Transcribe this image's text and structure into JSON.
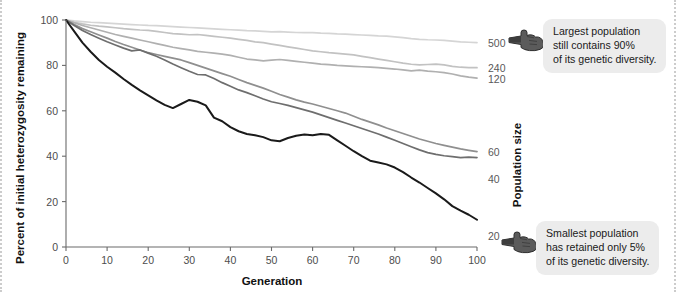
{
  "figure": {
    "background": "#ffffff",
    "border_color": "#cccccc"
  },
  "axes": {
    "y_title": "Percent of initial heterozygosity remaining",
    "x_title": "Generation",
    "right_title": "Population size",
    "x_ticks": [
      "0",
      "10",
      "20",
      "30",
      "40",
      "50",
      "60",
      "70",
      "80",
      "90",
      "100"
    ],
    "y_ticks": [
      "0",
      "20",
      "40",
      "60",
      "80",
      "100"
    ],
    "xlim": [
      0,
      100
    ],
    "ylim": [
      0,
      100
    ]
  },
  "right_labels": [
    {
      "name": "500",
      "y_value": 90
    },
    {
      "name": "240",
      "y_value": 79
    },
    {
      "name": "120",
      "y_value": 74
    },
    {
      "name": "60",
      "y_value": 42
    },
    {
      "name": "40",
      "y_value": 30
    },
    {
      "name": "20",
      "y_value": 5
    }
  ],
  "annotations": {
    "top": {
      "icon": "pointing-hand-icon",
      "lines": [
        "Largest population",
        "still contains 90%",
        "of its genetic diversity."
      ]
    },
    "bottom": {
      "icon": "pointing-hand-icon",
      "lines": [
        "Smallest population",
        "has retained only 5%",
        "of its genetic diversity."
      ]
    }
  },
  "chart_data": {
    "type": "line",
    "title": "",
    "xlabel": "Generation",
    "ylabel": "Percent of initial heterozygosity remaining",
    "right_axis_label": "Population size",
    "xlim": [
      0,
      100
    ],
    "ylim": [
      0,
      100
    ],
    "grid": false,
    "legend": "right-edge-labels",
    "x": [
      0,
      2,
      4,
      6,
      8,
      10,
      12,
      14,
      16,
      18,
      20,
      22,
      24,
      26,
      28,
      30,
      32,
      34,
      36,
      38,
      40,
      42,
      44,
      46,
      48,
      50,
      52,
      54,
      56,
      58,
      60,
      62,
      64,
      66,
      68,
      70,
      72,
      74,
      76,
      78,
      80,
      82,
      84,
      86,
      88,
      90,
      92,
      94,
      96,
      98,
      100
    ],
    "series": [
      {
        "name": "500",
        "color": "#d5d5d5",
        "values": [
          100,
          99.6,
          99.3,
          99.0,
          98.8,
          98.6,
          98.4,
          98.2,
          98.0,
          97.8,
          97.6,
          97.5,
          97.3,
          97.1,
          96.9,
          96.7,
          96.5,
          96.3,
          96.1,
          95.9,
          95.7,
          95.5,
          95.3,
          95.2,
          95.0,
          94.8,
          94.9,
          94.7,
          94.5,
          94.4,
          94.4,
          94.2,
          94.1,
          93.9,
          93.8,
          93.6,
          93.4,
          93.2,
          93.0,
          92.9,
          92.6,
          92.2,
          91.8,
          91.5,
          91.3,
          91.2,
          91.0,
          90.7,
          90.4,
          90.2,
          90.0
        ]
      },
      {
        "name": "240",
        "color": "#c2c2c2",
        "values": [
          100,
          99.0,
          98.3,
          97.7,
          97.3,
          97.0,
          96.6,
          96.2,
          95.9,
          95.6,
          95.4,
          95.0,
          94.5,
          94.0,
          93.8,
          93.5,
          93.6,
          93.2,
          92.8,
          92.4,
          92.0,
          91.5,
          91.0,
          90.4,
          90.0,
          89.4,
          88.8,
          88.2,
          87.6,
          87.0,
          86.4,
          86.0,
          85.6,
          85.3,
          85.0,
          84.6,
          84.0,
          83.4,
          82.8,
          82.2,
          81.6,
          81.0,
          80.5,
          80.2,
          80.4,
          80.6,
          80.2,
          79.6,
          79.2,
          79.0,
          79.0
        ]
      },
      {
        "name": "120",
        "color": "#b0b0b0",
        "values": [
          100,
          98.8,
          97.6,
          96.6,
          95.6,
          94.6,
          93.6,
          92.8,
          92.0,
          91.2,
          90.4,
          89.6,
          88.8,
          88.0,
          87.4,
          86.8,
          86.2,
          85.8,
          85.4,
          85.0,
          84.4,
          83.6,
          82.8,
          82.4,
          82.0,
          82.3,
          82.6,
          82.2,
          81.8,
          81.4,
          81.0,
          80.6,
          80.3,
          80.0,
          79.8,
          79.6,
          79.4,
          79.2,
          79.0,
          78.7,
          78.4,
          78.0,
          77.6,
          77.9,
          77.5,
          77.2,
          76.8,
          76.2,
          75.4,
          74.8,
          74.4
        ]
      },
      {
        "name": "60",
        "color": "#8f8f8f",
        "values": [
          100,
          98.0,
          96.2,
          94.8,
          93.4,
          92.0,
          90.5,
          89.2,
          88.0,
          86.8,
          85.6,
          84.8,
          84.0,
          83.2,
          82.4,
          81.2,
          80.0,
          78.8,
          77.6,
          76.4,
          75.2,
          73.8,
          72.4,
          71.2,
          70.0,
          68.6,
          67.2,
          66.0,
          64.8,
          63.8,
          63.0,
          62.0,
          61.0,
          60.0,
          59.0,
          57.6,
          56.2,
          55.0,
          53.8,
          52.4,
          51.2,
          50.0,
          48.8,
          47.6,
          46.6,
          45.6,
          44.8,
          44.0,
          43.2,
          42.6,
          42.0
        ]
      },
      {
        "name": "40",
        "color": "#6e6e6e",
        "values": [
          100,
          97.6,
          95.4,
          93.6,
          92.0,
          90.4,
          89.0,
          87.6,
          86.4,
          86.8,
          85.4,
          84.0,
          82.4,
          80.6,
          79.0,
          77.4,
          76.0,
          75.8,
          74.2,
          72.4,
          70.8,
          69.2,
          68.0,
          66.6,
          65.2,
          64.0,
          63.2,
          62.4,
          61.4,
          60.4,
          59.4,
          58.2,
          57.0,
          55.8,
          54.6,
          53.4,
          52.2,
          51.0,
          49.8,
          48.4,
          47.0,
          45.6,
          44.2,
          42.8,
          41.6,
          40.8,
          40.2,
          39.8,
          39.4,
          39.6,
          39.4
        ]
      },
      {
        "name": "20",
        "color": "#1a1a1a",
        "values": [
          100,
          95.0,
          90.0,
          86.0,
          82.4,
          79.4,
          76.8,
          74.0,
          71.4,
          69.0,
          66.8,
          64.6,
          62.6,
          61.2,
          63.0,
          64.8,
          64.0,
          62.4,
          57.0,
          55.4,
          52.8,
          51.0,
          49.8,
          49.2,
          48.4,
          47.0,
          46.6,
          48.0,
          49.0,
          49.6,
          49.2,
          49.8,
          49.4,
          47.0,
          44.6,
          42.2,
          40.0,
          38.0,
          37.2,
          36.4,
          35.0,
          33.0,
          30.6,
          28.4,
          26.0,
          23.6,
          21.0,
          18.0,
          16.0,
          14.2,
          12.0
        ]
      }
    ]
  }
}
